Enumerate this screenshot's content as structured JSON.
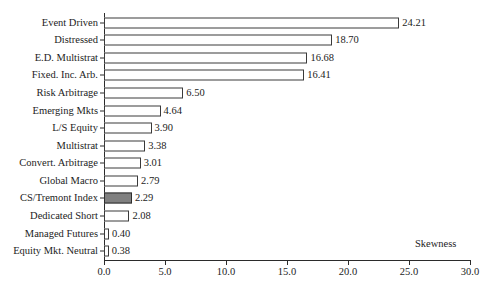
{
  "chart_data": {
    "type": "bar",
    "orientation": "horizontal",
    "title": "",
    "xlabel": "Skewness",
    "ylabel": "",
    "xlim": [
      0.0,
      30.0
    ],
    "xticks": [
      "0.0",
      "5.0",
      "10.0",
      "15.0",
      "20.0",
      "25.0",
      "30.0"
    ],
    "xtick_values": [
      0.0,
      5.0,
      10.0,
      15.0,
      20.0,
      25.0,
      30.0
    ],
    "grid": false,
    "legend": null,
    "categories": [
      "Event Driven",
      "Distressed",
      "E.D. Multistrat",
      "Fixed. Inc. Arb.",
      "Risk Arbitrage",
      "Emerging Mkts",
      "L/S Equity",
      "Multistrat",
      "Convert. Arbitrage",
      "Global Macro",
      "CS/Tremont Index",
      "Dedicated Short",
      "Managed Futures",
      "Equity Mkt. Neutral"
    ],
    "values": [
      24.21,
      18.7,
      16.68,
      16.41,
      6.5,
      4.64,
      3.9,
      3.38,
      3.01,
      2.79,
      2.29,
      2.08,
      0.4,
      0.38
    ],
    "value_labels": [
      "24.21",
      "18.70",
      "16.68",
      "16.41",
      "6.50",
      "4.64",
      "3.90",
      "3.38",
      "3.01",
      "2.79",
      "2.29",
      "2.08",
      "0.40",
      "0.38"
    ],
    "highlight_category": "CS/Tremont Index",
    "colors": {
      "bar_fill": "#ffffff",
      "bar_border": "#3a3a3a",
      "highlight_fill": "#808080",
      "axis": "#2b2b2b",
      "text": "#1c1c1c",
      "background": "#ffffff"
    }
  }
}
